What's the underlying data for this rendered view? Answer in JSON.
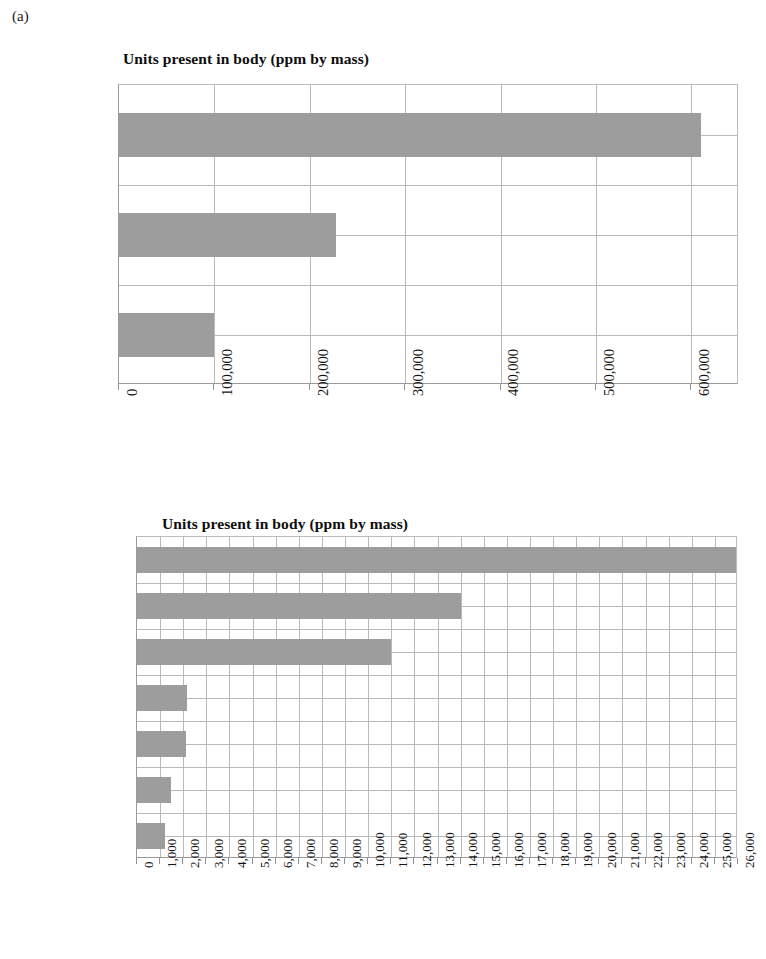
{
  "panel": {
    "label": "(a)"
  },
  "charts": [
    {
      "id": "macro-elements",
      "title": "Units present in body (ppm by mass)",
      "categories": [
        "Hydrogen",
        "Carbon",
        "Oxygen"
      ],
      "values": [
        100000,
        228000,
        610000
      ],
      "ticks": [
        "0",
        "100,000",
        "200,000",
        "300,000",
        "400,000",
        "500,000",
        "600,000"
      ],
      "tick_values": [
        0,
        100000,
        200000,
        300000,
        400000,
        500000,
        600000
      ],
      "xmin": 0,
      "xmax": 650000
    },
    {
      "id": "minor-elements",
      "title": "Units present in body (ppm by mass)",
      "categories": [
        "Chloride",
        "Sodium",
        "Potassium",
        "Sulphur",
        "Phosphorus",
        "Calcium",
        "Nitrogen"
      ],
      "values": [
        1200,
        1450,
        2100,
        2150,
        11000,
        14000,
        26000
      ],
      "ticks": [
        "0",
        "1,000",
        "2,000",
        "3,000",
        "4,000",
        "5,000",
        "6,000",
        "7,000",
        "8,000",
        "9,000",
        "10,000",
        "11,000",
        "12,000",
        "13,000",
        "14,000",
        "15,000",
        "16,000",
        "17,000",
        "18,000",
        "19,000",
        "20,000",
        "21,000",
        "22,000",
        "23,000",
        "24,000",
        "25,000",
        "26,000"
      ],
      "tick_values": [
        0,
        1000,
        2000,
        3000,
        4000,
        5000,
        6000,
        7000,
        8000,
        9000,
        10000,
        11000,
        12000,
        13000,
        14000,
        15000,
        16000,
        17000,
        18000,
        19000,
        20000,
        21000,
        22000,
        23000,
        24000,
        25000,
        26000
      ],
      "xmin": 0,
      "xmax": 26000
    }
  ],
  "colors": {
    "bar_fill": "#9d9d9d",
    "gridline": "#b9b9b9",
    "axis": "#8f8f8f",
    "text": "#111111",
    "background": "#ffffff"
  },
  "chart_data": [
    {
      "type": "bar",
      "orientation": "horizontal",
      "title": "Units present in body (ppm by mass)",
      "xlabel": "",
      "ylabel": "",
      "categories": [
        "Hydrogen",
        "Carbon",
        "Oxygen"
      ],
      "values": [
        100000,
        228000,
        610000
      ],
      "xlim": [
        0,
        650000
      ],
      "xticks": [
        0,
        100000,
        200000,
        300000,
        400000,
        500000,
        600000
      ],
      "xticklabels": [
        "0",
        "100,000",
        "200,000",
        "300,000",
        "400,000",
        "500,000",
        "600,000"
      ],
      "grid": true,
      "legend": false,
      "units": "ppm by mass"
    },
    {
      "type": "bar",
      "orientation": "horizontal",
      "title": "Units present in body (ppm by mass)",
      "xlabel": "",
      "ylabel": "",
      "categories": [
        "Chloride",
        "Sodium",
        "Potassium",
        "Sulphur",
        "Phosphorus",
        "Calcium",
        "Nitrogen"
      ],
      "values": [
        1200,
        1450,
        2100,
        2150,
        11000,
        14000,
        26000
      ],
      "xlim": [
        0,
        26000
      ],
      "xticks": [
        0,
        1000,
        2000,
        3000,
        4000,
        5000,
        6000,
        7000,
        8000,
        9000,
        10000,
        11000,
        12000,
        13000,
        14000,
        15000,
        16000,
        17000,
        18000,
        19000,
        20000,
        21000,
        22000,
        23000,
        24000,
        25000,
        26000
      ],
      "xticklabels": [
        "0",
        "1,000",
        "2,000",
        "3,000",
        "4,000",
        "5,000",
        "6,000",
        "7,000",
        "8,000",
        "9,000",
        "10,000",
        "11,000",
        "12,000",
        "13,000",
        "14,000",
        "15,000",
        "16,000",
        "17,000",
        "18,000",
        "19,000",
        "20,000",
        "21,000",
        "22,000",
        "23,000",
        "24,000",
        "25,000",
        "26,000"
      ],
      "grid": true,
      "legend": false,
      "units": "ppm by mass"
    }
  ]
}
